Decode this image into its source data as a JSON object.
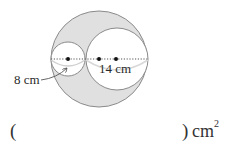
{
  "diagram": {
    "type": "geometry-figure",
    "colors": {
      "shaded_fill": "#e0e0e0",
      "outline": "#8a8a8a",
      "inner_fill": "#ffffff",
      "dot": "#111111",
      "dimension_arc": "#cfcfcf"
    },
    "shapes": {
      "outer_circle": {
        "cx": 99,
        "cy": 59,
        "r": 48
      },
      "small_circle": {
        "cx": 68,
        "cy": 59,
        "r": 17
      },
      "large_inner_circle": {
        "cx": 117,
        "cy": 59,
        "r": 31
      }
    },
    "center_dots": [
      {
        "name": "small-circle-center",
        "x": 68,
        "y": 59
      },
      {
        "name": "outer-circle-center",
        "x": 99,
        "y": 59
      },
      {
        "name": "large-inner-circle-center",
        "x": 116,
        "y": 59
      }
    ],
    "labels": {
      "small_diameter": "8 cm",
      "large_diameter": "14 cm"
    }
  },
  "answer": {
    "open_paren": "(",
    "close_paren": ")",
    "unit": "cm",
    "unit_exponent": "2"
  }
}
